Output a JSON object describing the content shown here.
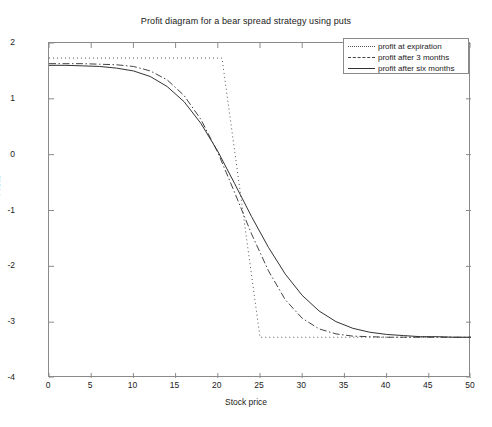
{
  "chart_data": {
    "type": "line",
    "title": "Profit diagram for a bear spread strategy using puts",
    "xlabel": "Stock price",
    "ylabel": "Profit",
    "xlim": [
      0,
      50
    ],
    "ylim": [
      -4,
      2
    ],
    "xticks": [
      0,
      5,
      10,
      15,
      20,
      25,
      30,
      35,
      40,
      45,
      50
    ],
    "yticks": [
      2,
      1,
      0,
      -1,
      -2,
      -3,
      -4
    ],
    "grid": false,
    "legend_position": "top-right",
    "max_profit": 1.73,
    "max_loss": -3.27,
    "lower_strike": 20.5,
    "upper_strike": 25,
    "series": [
      {
        "name": "profit at expiration",
        "style": "dotted",
        "color": "#555555",
        "x": [
          0,
          20.5,
          25,
          50
        ],
        "y": [
          1.73,
          1.73,
          -3.27,
          -3.27
        ]
      },
      {
        "name": "profit after 3 months",
        "style": "dash-dot",
        "color": "#444444",
        "x": [
          0,
          2,
          4,
          6,
          8,
          10,
          12,
          14,
          16,
          18,
          20,
          22,
          24,
          26,
          28,
          30,
          32,
          34,
          36,
          38,
          40,
          42,
          44,
          46,
          48,
          50
        ],
        "y": [
          1.63,
          1.63,
          1.63,
          1.62,
          1.61,
          1.58,
          1.5,
          1.34,
          1.06,
          0.63,
          0.04,
          -0.68,
          -1.42,
          -2.08,
          -2.6,
          -2.93,
          -3.12,
          -3.21,
          -3.25,
          -3.26,
          -3.27,
          -3.27,
          -3.27,
          -3.27,
          -3.27,
          -3.27
        ]
      },
      {
        "name": "profit after six months",
        "style": "solid",
        "color": "#333333",
        "x": [
          0,
          2,
          4,
          6,
          8,
          10,
          12,
          14,
          16,
          18,
          20,
          22,
          24,
          26,
          28,
          30,
          32,
          34,
          36,
          38,
          40,
          42,
          44,
          46,
          48,
          50
        ],
        "y": [
          1.6,
          1.6,
          1.59,
          1.58,
          1.55,
          1.5,
          1.4,
          1.22,
          0.95,
          0.56,
          0.06,
          -0.52,
          -1.11,
          -1.66,
          -2.14,
          -2.52,
          -2.8,
          -2.99,
          -3.11,
          -3.18,
          -3.22,
          -3.24,
          -3.26,
          -3.26,
          -3.27,
          -3.27
        ]
      }
    ]
  },
  "legend": {
    "items": [
      {
        "label": "profit at expiration"
      },
      {
        "label": "profit after 3 months"
      },
      {
        "label": "profit after six months"
      }
    ]
  }
}
